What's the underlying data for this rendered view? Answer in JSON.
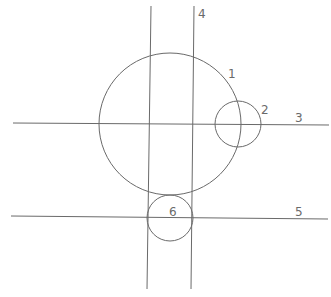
{
  "diagram": {
    "type": "geometric-construction",
    "stroke_color": "#6a6a6a",
    "background": "#ffffff",
    "circles": [
      {
        "id": "1",
        "label": "1",
        "cx": 170,
        "cy": 124,
        "r": 71,
        "label_x": 228,
        "label_y": 78
      },
      {
        "id": "2",
        "label": "2",
        "cx": 238,
        "cy": 124,
        "r": 23,
        "label_x": 261,
        "label_y": 114
      },
      {
        "id": "6",
        "label": "6",
        "cx": 170,
        "cy": 218,
        "r": 23,
        "label_x": 169,
        "label_y": 216
      }
    ],
    "lines": [
      {
        "id": "3",
        "label": "3",
        "x1": 13,
        "y1": 123,
        "x2": 329,
        "y2": 125,
        "label_x": 295,
        "label_y": 122
      },
      {
        "id": "4",
        "label": "4",
        "x1": 194,
        "y1": 6,
        "x2": 191,
        "y2": 289,
        "label_x": 198,
        "label_y": 18
      },
      {
        "id": "4b",
        "label": "",
        "x1": 151,
        "y1": 6,
        "x2": 147,
        "y2": 289,
        "label_x": 0,
        "label_y": 0
      },
      {
        "id": "5",
        "label": "5",
        "x1": 11,
        "y1": 216,
        "x2": 328,
        "y2": 219,
        "label_x": 295,
        "label_y": 216
      }
    ]
  }
}
